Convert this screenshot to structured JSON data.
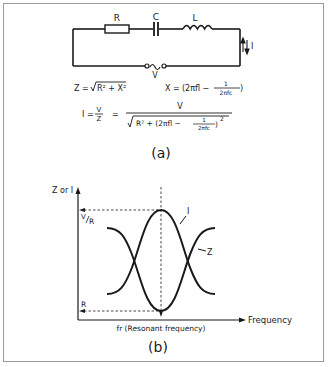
{
  "figure_a": {
    "caption": "(a)",
    "circuit": {
      "resistor_label": "R",
      "capacitor_label": "C",
      "inductor_label": "L",
      "source_label": "V",
      "current_label": "I"
    },
    "formulas": {
      "impedance": {
        "lhs": "Z =",
        "radicand": "R² + X²"
      },
      "reactance": {
        "lhs": "X =",
        "term1": "(2πfl −",
        "frac_num": "1",
        "frac_den": "2πfc",
        "close": ")"
      },
      "current": {
        "lhs": "I =",
        "ratio_num": "V",
        "ratio_den": "Z",
        "eq": "=",
        "num": "V",
        "den_r": "R² + (2πfl −",
        "den_frac_num": "1",
        "den_frac_den": "2πfc",
        "den_close": ")",
        "den_exp": "2"
      }
    }
  },
  "figure_b": {
    "caption": "(b)",
    "y_axis_label": "Z or I",
    "x_axis_label": "Frequency",
    "x_marker_label": "fr (Resonant frequency)",
    "level_high_label_num": "V",
    "level_high_label_den": "R",
    "level_low_label": "R",
    "curve_i_label": "I",
    "curve_z_label": "Z"
  },
  "colors": {
    "ink": "#1a1a1a",
    "frame": "#9a9a9a",
    "background": "#ffffff"
  }
}
